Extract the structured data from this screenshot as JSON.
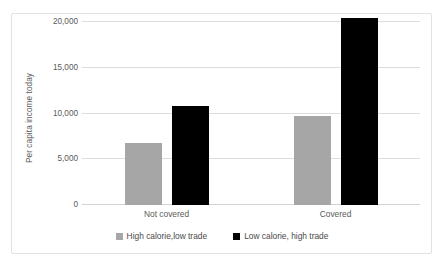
{
  "chart_data": {
    "type": "bar",
    "title": "",
    "subtitle": "",
    "xlabel": "",
    "ylabel": "Per capita income today",
    "categories": [
      "Not covered",
      "Covered"
    ],
    "series": [
      {
        "name": "High calorie,low trade",
        "color": "#a6a6a6",
        "values": [
          6800,
          9700
        ]
      },
      {
        "name": "Low calorie, high trade",
        "color": "#000000",
        "values": [
          10800,
          20400
        ]
      }
    ],
    "ylim": [
      0,
      20000
    ],
    "ytick_values": [
      0,
      5000,
      10000,
      15000,
      20000
    ],
    "ytick_labels": [
      "0",
      "5,000",
      "10,000",
      "15,000",
      "20,000"
    ],
    "grid": "horizontal",
    "legend_position": "bottom"
  },
  "colors": {
    "series_gray": "#a6a6a6",
    "series_black": "#000000",
    "gridline": "#dcdcdc",
    "text": "#5a5a5a",
    "frame_border": "#e2e2e2",
    "background": "#ffffff"
  }
}
